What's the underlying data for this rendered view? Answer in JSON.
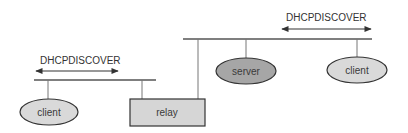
{
  "diagram": {
    "colors": {
      "line": "#555555",
      "client_fill": "#d9d9d9",
      "server_fill": "#a6a6a6",
      "relay_fill": "#d6d6d6",
      "outline": "#333333"
    },
    "left_segment": {
      "message_label": "DHCPDISCOVER"
    },
    "right_segment": {
      "message_label": "DHCPDISCOVER"
    },
    "nodes": [
      {
        "id": "client-left",
        "label": "client",
        "shape": "ellipse"
      },
      {
        "id": "relay",
        "label": "relay",
        "shape": "rectangle"
      },
      {
        "id": "server",
        "label": "server",
        "shape": "ellipse"
      },
      {
        "id": "client-right",
        "label": "client",
        "shape": "ellipse"
      }
    ],
    "edges": [
      {
        "from": "client-left",
        "to": "left-network"
      },
      {
        "from": "relay",
        "to": "left-network"
      },
      {
        "from": "relay",
        "to": "right-network"
      },
      {
        "from": "server",
        "to": "right-network"
      },
      {
        "from": "client-right",
        "to": "right-network"
      }
    ]
  }
}
